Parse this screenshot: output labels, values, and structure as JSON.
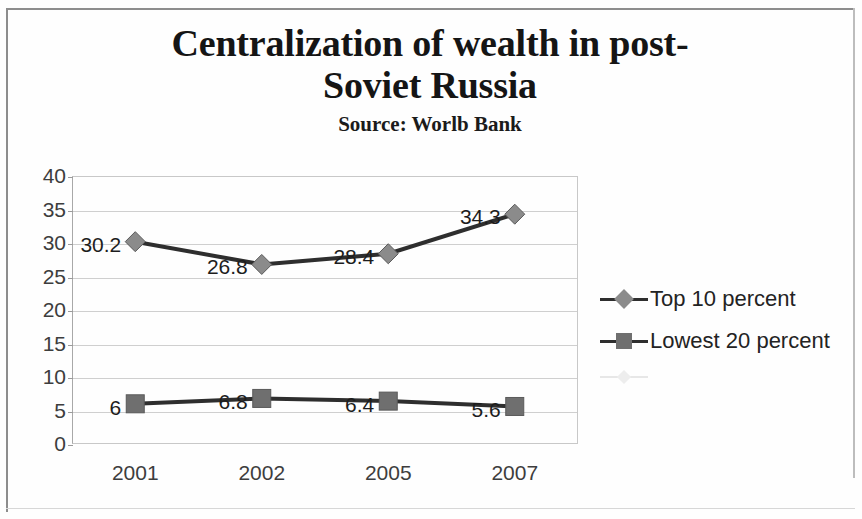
{
  "chart_data": {
    "type": "line",
    "title": "Centralization of wealth in post-\nSoviet Russia",
    "subtitle": "Source: Worlb Bank",
    "xlabel": "",
    "ylabel": "",
    "categories": [
      "2001",
      "2002",
      "2005",
      "2007"
    ],
    "ylim": [
      0,
      40
    ],
    "yticks": [
      "0",
      "5",
      "10",
      "15",
      "20",
      "25",
      "30",
      "35",
      "40"
    ],
    "grid": true,
    "legend_position": "right",
    "series": [
      {
        "name": "Top 10 percent",
        "marker": "diamond",
        "marker_color": "#8b8b8b",
        "line_color": "#2e2e2e",
        "values": [
          30.2,
          26.8,
          28.4,
          34.3
        ],
        "data_labels": [
          "30.2",
          "26.8",
          "28.4",
          "34.3"
        ]
      },
      {
        "name": "Lowest 20 percent",
        "marker": "square",
        "marker_color": "#6f6f6f",
        "line_color": "#2e2e2e",
        "values": [
          6,
          6.8,
          6.4,
          5.6
        ],
        "data_labels": [
          "6",
          "6.8",
          "6.4",
          "5.6"
        ]
      }
    ]
  },
  "legend": {
    "items": [
      {
        "label": "Top 10 percent",
        "marker": "diamond"
      },
      {
        "label": "Lowest 20 percent",
        "marker": "square"
      }
    ],
    "ghost_item_label": ""
  },
  "colors": {
    "line": "#2e2e2e",
    "diamond_marker": "#8b8b8b",
    "square_marker": "#6f6f6f",
    "gridline": "#cfcfcf",
    "axis_text": "#3d3d3d",
    "title_text": "#151515",
    "page_frame": "#8d8d8d"
  }
}
